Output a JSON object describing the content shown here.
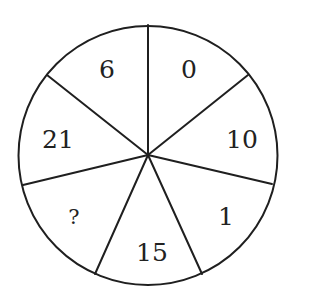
{
  "puzzle": {
    "type": "number-wheel",
    "sector_count": 7,
    "stroke_color": "#1f1f1f",
    "text_color": "#222222",
    "background": "#ffffff",
    "sectors": [
      {
        "position": "top-right",
        "value": "0"
      },
      {
        "position": "right",
        "value": "10"
      },
      {
        "position": "lower-right",
        "value": "1"
      },
      {
        "position": "bottom",
        "value": "15"
      },
      {
        "position": "lower-left",
        "value": "?"
      },
      {
        "position": "left",
        "value": "21"
      },
      {
        "position": "top-left",
        "value": "6"
      }
    ]
  }
}
